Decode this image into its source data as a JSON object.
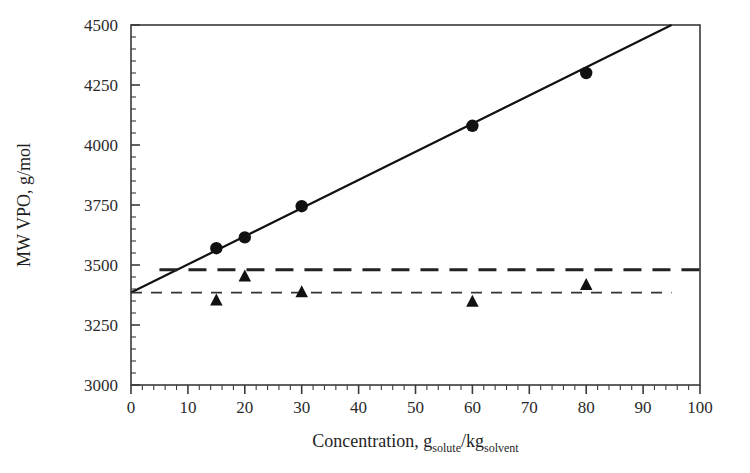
{
  "chart_data": {
    "type": "scatter",
    "title": "",
    "xlabel": "Concentration, g_solute/kg_solvent",
    "xlabel_parts": {
      "main": "Concentration, g",
      "sub1": "solute",
      "slash": "/kg",
      "sub2": "solvent"
    },
    "ylabel": "MW VPO, g/mol",
    "xlim": [
      0,
      100
    ],
    "ylim": [
      3000,
      4500
    ],
    "xticks": [
      0,
      10,
      20,
      30,
      40,
      50,
      60,
      70,
      80,
      90,
      100
    ],
    "xtick_labels": [
      "0",
      "10",
      "20",
      "30",
      "40",
      "50",
      "60",
      "70",
      "80",
      "90",
      "100"
    ],
    "yticks": [
      3000,
      3250,
      3500,
      3750,
      4000,
      4250,
      4500
    ],
    "ytick_labels": [
      "3000",
      "3250",
      "3500",
      "3750",
      "4000",
      "4250",
      "4500"
    ],
    "x_minor_tick_step": 2,
    "y_minor_tick_step": 50,
    "grid": false,
    "legend": "none",
    "series": [
      {
        "name": "MW VPO measured",
        "marker": "filled-circle",
        "color": "#111111",
        "x": [
          15,
          20,
          30,
          60,
          80
        ],
        "y": [
          3570,
          3615,
          3745,
          4080,
          4300
        ]
      },
      {
        "name": "MW corrected",
        "marker": "filled-triangle",
        "color": "#111111",
        "x": [
          15,
          20,
          30,
          60,
          80
        ],
        "y": [
          3350,
          3450,
          3385,
          3345,
          3415
        ]
      }
    ],
    "lines": [
      {
        "name": "regression-line",
        "style": "solid",
        "color": "#111111",
        "width": 2.2,
        "x": [
          0,
          95
        ],
        "y": [
          3385,
          4500
        ]
      },
      {
        "name": "thick-dashed-reference",
        "style": "dashed-thick",
        "color": "#222222",
        "width": 3.0,
        "x": [
          5,
          100
        ],
        "y": [
          3480,
          3480
        ]
      },
      {
        "name": "thin-dashed-reference",
        "style": "dashed-thin",
        "color": "#333333",
        "width": 1.6,
        "x": [
          0,
          95
        ],
        "y": [
          3385,
          3385
        ]
      }
    ]
  },
  "colors": {
    "axis": "#3a3a3a",
    "marker": "#111111",
    "background": "#ffffff"
  }
}
